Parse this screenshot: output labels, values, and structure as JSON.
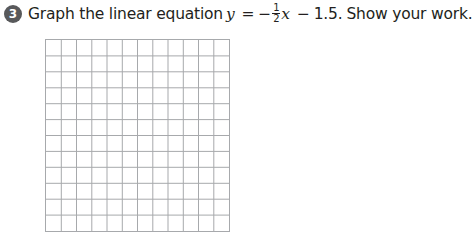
{
  "question": {
    "number": "3",
    "prefix": "Graph the linear equation",
    "lhs": "y",
    "equals": "=",
    "minus": "−",
    "fraction": {
      "numerator": "1",
      "denominator": "2"
    },
    "variable": "x",
    "minus2": "−",
    "constant": "1.5.",
    "suffix": "Show your work."
  },
  "grid": {
    "columns": 12,
    "rows": 12,
    "line_color": "#a7a9ac"
  },
  "colors": {
    "badge": "#58595b",
    "text": "#231f20"
  }
}
